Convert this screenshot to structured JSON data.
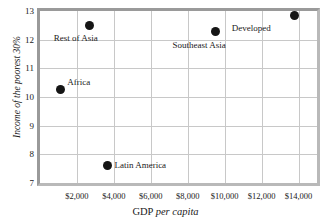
{
  "chart_data": {
    "type": "scatter",
    "title": "",
    "xlabel_prefix": "GDP ",
    "xlabel_italic": "per capita",
    "xlabel": "GDP per capita",
    "ylabel": "Income of the poorest 30%",
    "xlim": [
      0,
      15000
    ],
    "ylim": [
      7,
      13
    ],
    "grid": true,
    "legend": "none",
    "xticks": [
      "$2,000",
      "$4,000",
      "$6,000",
      "$8,000",
      "$10,000",
      "$12,000",
      "$14,000"
    ],
    "xtick_values": [
      2000,
      4000,
      6000,
      8000,
      10000,
      12000,
      14000
    ],
    "yticks": [
      "13",
      "12",
      "11",
      "10",
      "9",
      "8",
      "7"
    ],
    "ytick_values": [
      13,
      12,
      11,
      10,
      9,
      8,
      7
    ],
    "points": [
      {
        "label": "Rest of Asia",
        "x": 2700,
        "y": 12.5,
        "label_dx": -36,
        "label_dy": 8
      },
      {
        "label": "Southeast Asia",
        "x": 9500,
        "y": 12.3,
        "label_dx": -43,
        "label_dy": 9
      },
      {
        "label": "Developed",
        "x": 13800,
        "y": 12.85,
        "label_dx": -63,
        "label_dy": 8
      },
      {
        "label": "Africa",
        "x": 1100,
        "y": 10.25,
        "label_dx": 7,
        "label_dy": -13
      },
      {
        "label": "Latin America",
        "x": 3650,
        "y": 7.62,
        "label_dx": 7,
        "label_dy": -5
      }
    ]
  },
  "colors": {
    "point": "#151515",
    "grid": "#c8c8c8",
    "frame": "#9a9a9a",
    "text": "#1a1a1a",
    "background": "#ffffff"
  }
}
